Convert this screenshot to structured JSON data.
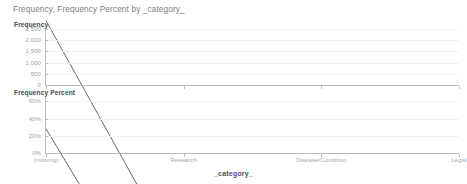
{
  "header": {
    "title": "Frequency, Frequency Percent by _category_"
  },
  "axes": {
    "x_title": "_category_",
    "freq_title": "Frequency",
    "pct_title": "Frequency Percent"
  },
  "chart_data": [
    {
      "type": "line",
      "title": "Frequency",
      "xlabel": "_category_",
      "ylabel": "Frequency",
      "categories": [
        "(missing)",
        "Research",
        "Disease/Condition",
        "Legal"
      ],
      "values": [
        2550,
        1050,
        700,
        300
      ],
      "ylim": [
        0,
        2500
      ],
      "yticks": [
        0,
        500,
        1000,
        1500,
        2000,
        2500
      ],
      "ytick_labels": [
        "0",
        "500",
        "1,000",
        "1,500",
        "2,000",
        "2,500"
      ],
      "grid": true,
      "legend": "none",
      "line_color": "#6b6b6b"
    },
    {
      "type": "line",
      "title": "Frequency Percent",
      "xlabel": "_category_",
      "ylabel": "Frequency Percent",
      "categories": [
        "(missing)",
        "Research",
        "Disease/Condition",
        "Legal"
      ],
      "values": [
        60,
        24,
        16,
        7
      ],
      "ylim": [
        0,
        65
      ],
      "yticks": [
        0,
        20,
        40,
        60
      ],
      "ytick_labels": [
        "0%",
        "20%",
        "40%",
        "60%"
      ],
      "grid": true,
      "legend": "none",
      "line_color": "#6b6b6b"
    }
  ]
}
